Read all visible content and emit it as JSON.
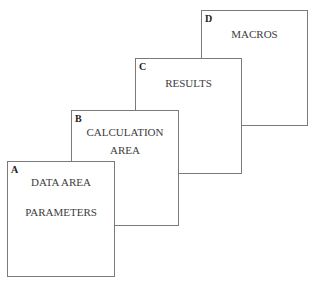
{
  "diagram": {
    "sheets": [
      {
        "id": "D",
        "letter": "D",
        "lines": [
          "MACROS"
        ]
      },
      {
        "id": "C",
        "letter": "C",
        "lines": [
          "RESULTS"
        ]
      },
      {
        "id": "B",
        "letter": "B",
        "lines": [
          "CALCULATION",
          "AREA"
        ]
      },
      {
        "id": "A",
        "letter": "A",
        "lines": [
          "DATA AREA",
          "PARAMETERS"
        ]
      }
    ]
  }
}
